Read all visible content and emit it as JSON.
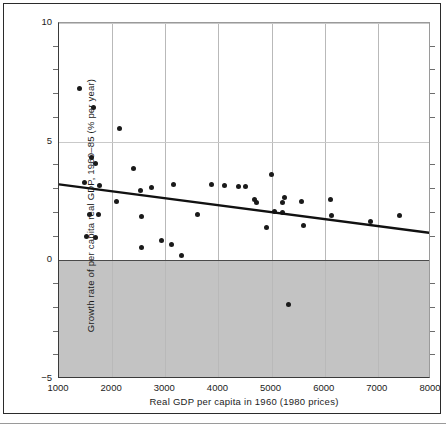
{
  "figure": {
    "background_color": "#ffffff",
    "frame_color": "#2b2b2b",
    "shaded_region_color": "#c3c3c3",
    "point_color": "#1a1a1a",
    "trend_line_color": "#111111",
    "caption_stub": ""
  },
  "chart_data": {
    "type": "scatter",
    "title": "",
    "subtitle": "",
    "xlabel": "Real GDP per capita in 1960 (1980 prices)",
    "ylabel": "Growth rate of per capita real GDP, 1960–85 (% per year)",
    "xlim": [
      1000,
      8000
    ],
    "ylim": [
      -5,
      10
    ],
    "xticks": [
      1000,
      2000,
      3000,
      4000,
      5000,
      6000,
      7000,
      8000
    ],
    "xtick_labels": [
      "1000",
      "2000",
      "3000",
      "4000",
      "5000",
      "6000",
      "7000",
      "8000"
    ],
    "yticks": [
      -5,
      0,
      5,
      10
    ],
    "ytick_labels": [
      "−5",
      "0",
      "5",
      "10"
    ],
    "y_minor_tick_step": 1,
    "grid": "vertical gridlines at each x tick, horizontal gridlines at 5 and 10",
    "legend": "none",
    "annotations": [
      "Shaded grey band marks the region of negative growth (below 0% per year)"
    ],
    "series": [
      {
        "name": "Countries",
        "marker": "filled circle",
        "points": [
          {
            "x": 1380,
            "y": 7.25
          },
          {
            "x": 1640,
            "y": 6.45
          },
          {
            "x": 2130,
            "y": 5.55
          },
          {
            "x": 1620,
            "y": 4.35
          },
          {
            "x": 1680,
            "y": 4.1
          },
          {
            "x": 2400,
            "y": 3.85
          },
          {
            "x": 1480,
            "y": 3.3
          },
          {
            "x": 1770,
            "y": 3.15
          },
          {
            "x": 2740,
            "y": 3.05
          },
          {
            "x": 3160,
            "y": 3.2
          },
          {
            "x": 3870,
            "y": 3.2
          },
          {
            "x": 4120,
            "y": 3.15
          },
          {
            "x": 4380,
            "y": 3.1
          },
          {
            "x": 4500,
            "y": 3.1
          },
          {
            "x": 2540,
            "y": 2.95
          },
          {
            "x": 4990,
            "y": 3.6
          },
          {
            "x": 2090,
            "y": 2.5
          },
          {
            "x": 4670,
            "y": 2.55
          },
          {
            "x": 4720,
            "y": 2.45
          },
          {
            "x": 5250,
            "y": 2.65
          },
          {
            "x": 5200,
            "y": 2.45
          },
          {
            "x": 5570,
            "y": 2.5
          },
          {
            "x": 6100,
            "y": 2.55
          },
          {
            "x": 1570,
            "y": 1.95
          },
          {
            "x": 1750,
            "y": 1.95
          },
          {
            "x": 2560,
            "y": 1.85
          },
          {
            "x": 3600,
            "y": 1.95
          },
          {
            "x": 5050,
            "y": 2.05
          },
          {
            "x": 5210,
            "y": 2.0
          },
          {
            "x": 6130,
            "y": 1.9
          },
          {
            "x": 7400,
            "y": 1.9
          },
          {
            "x": 6870,
            "y": 1.65
          },
          {
            "x": 4900,
            "y": 1.4
          },
          {
            "x": 5600,
            "y": 1.45
          },
          {
            "x": 1510,
            "y": 1.0
          },
          {
            "x": 1690,
            "y": 0.95
          },
          {
            "x": 2920,
            "y": 0.85
          },
          {
            "x": 3110,
            "y": 0.65
          },
          {
            "x": 2560,
            "y": 0.55
          },
          {
            "x": 3310,
            "y": 0.2
          },
          {
            "x": 5320,
            "y": -1.85
          }
        ]
      }
    ],
    "trend_line": {
      "name": "Fitted regression line",
      "x_start": 1000,
      "y_start": 3.2,
      "x_end": 8000,
      "y_end": 1.15,
      "slope_per_1000": -0.293,
      "style": "solid thick black"
    }
  },
  "axis_labels": {
    "x_title": "Real GDP per capita in 1960 (1980 prices)",
    "y_title": "Growth rate of per capita real GDP, 1960–85 (% per year)"
  }
}
